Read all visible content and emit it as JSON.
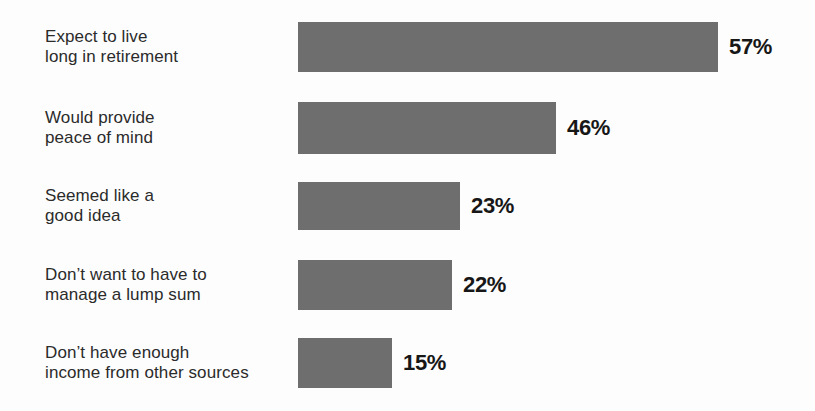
{
  "chart_data": {
    "type": "bar",
    "orientation": "horizontal",
    "title": "",
    "subtitle": "",
    "xlabel": "",
    "ylabel": "",
    "grid": false,
    "legend": false,
    "axis_visible": false,
    "value_suffix": "%",
    "xlim": [
      0,
      57
    ],
    "categories": [
      "Expect to live\nlong in retirement",
      "Would provide\npeace of mind",
      "Seemed like a\ngood idea",
      "Don’t want to have to\nmanage a lump sum",
      "Don’t have enough\nincome from other sources"
    ],
    "values": [
      57,
      46,
      23,
      22,
      15
    ],
    "value_labels": [
      "57%",
      "46%",
      "23%",
      "22%",
      "15%"
    ],
    "bar_color": "#6e6e6e",
    "label_color": "#2b2b2b",
    "value_color": "#171717",
    "background_color": "#fdfdfd"
  },
  "bars": [
    {
      "label": "Expect to live\nlong in retirement",
      "value_label": "57%",
      "top": 22,
      "height": 50,
      "width": 420
    },
    {
      "label": "Would provide\npeace of mind",
      "value_label": "46%",
      "top": 102,
      "height": 52,
      "width": 258
    },
    {
      "label": "Seemed like a\ngood idea",
      "value_label": "23%",
      "top": 182,
      "height": 48,
      "width": 162
    },
    {
      "label": "Don’t want to have to\nmanage a lump sum",
      "value_label": "22%",
      "top": 260,
      "height": 50,
      "width": 154
    },
    {
      "label": "Don’t have enough\nincome from other sources",
      "value_label": "15%",
      "top": 338,
      "height": 50,
      "width": 94
    }
  ]
}
